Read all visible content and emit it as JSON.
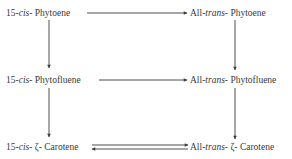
{
  "diagram": {
    "type": "reaction-pathway",
    "nodes": [
      {
        "id": "cis-phytoene",
        "prefix": "15-",
        "stereo": "cis",
        "sep": "- ",
        "name": "Phytoene"
      },
      {
        "id": "trans-phytoene",
        "prefix": "All-",
        "stereo": "trans",
        "sep": "- ",
        "name": "Phytoene"
      },
      {
        "id": "cis-phytofluene",
        "prefix": "15-",
        "stereo": "cis",
        "sep": "- ",
        "name": "Phytofluene"
      },
      {
        "id": "trans-phytofluene",
        "prefix": "All-",
        "stereo": "trans",
        "sep": "- ",
        "name": "Phytofluene"
      },
      {
        "id": "cis-zeta-carotene",
        "prefix": "15-",
        "stereo": "cis",
        "sep": "- ",
        "name": "ζ- Carotene"
      },
      {
        "id": "trans-zeta-carotene",
        "prefix": "All-",
        "stereo": "trans",
        "sep": "- ",
        "name": "ζ- Carotene"
      }
    ],
    "edges": [
      {
        "from": "cis-phytoene",
        "to": "trans-phytoene",
        "kind": "forward"
      },
      {
        "from": "cis-phytoene",
        "to": "cis-phytofluene",
        "kind": "forward"
      },
      {
        "from": "trans-phytoene",
        "to": "trans-phytofluene",
        "kind": "forward"
      },
      {
        "from": "cis-phytofluene",
        "to": "trans-phytofluene",
        "kind": "forward"
      },
      {
        "from": "cis-phytofluene",
        "to": "cis-zeta-carotene",
        "kind": "forward"
      },
      {
        "from": "trans-phytofluene",
        "to": "trans-zeta-carotene",
        "kind": "forward"
      },
      {
        "from": "cis-zeta-carotene",
        "to": "trans-zeta-carotene",
        "kind": "reversible"
      }
    ]
  }
}
